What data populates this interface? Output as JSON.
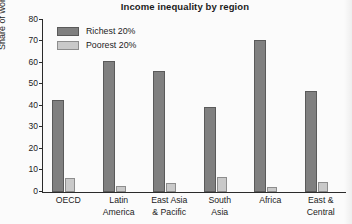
{
  "chart_data": {
    "type": "bar",
    "title": "Income inequality by region",
    "xlabel": "",
    "ylabel": "Share of world income (%)",
    "ylim": [
      0,
      80
    ],
    "yticks": [
      0,
      10,
      20,
      30,
      40,
      50,
      60,
      70,
      80
    ],
    "grid": false,
    "legend_position": "top-left",
    "categories": [
      "OECD",
      "Latin America",
      "East Asia & Pacific",
      "South Asia",
      "Africa",
      "East & Central"
    ],
    "category_lines": [
      [
        "OECD"
      ],
      [
        "Latin",
        "America"
      ],
      [
        "East Asia",
        "& Pacific"
      ],
      [
        "South",
        "Asia"
      ],
      [
        "Africa"
      ],
      [
        "East &",
        "Central"
      ]
    ],
    "series": [
      {
        "name": "Richest 20%",
        "color": "#808080",
        "values": [
          43,
          61,
          56.5,
          39.5,
          70.5,
          47
        ]
      },
      {
        "name": "Poorest 20%",
        "color": "#c9c9c9",
        "values": [
          6.5,
          2.8,
          4,
          7,
          2.2,
          4.5
        ]
      }
    ]
  },
  "colors": {
    "richest": "#808080",
    "poorest": "#c9c9c9",
    "axis": "#2b2b2b",
    "text": "#1b1b1b",
    "background": "#fbfbfb"
  }
}
